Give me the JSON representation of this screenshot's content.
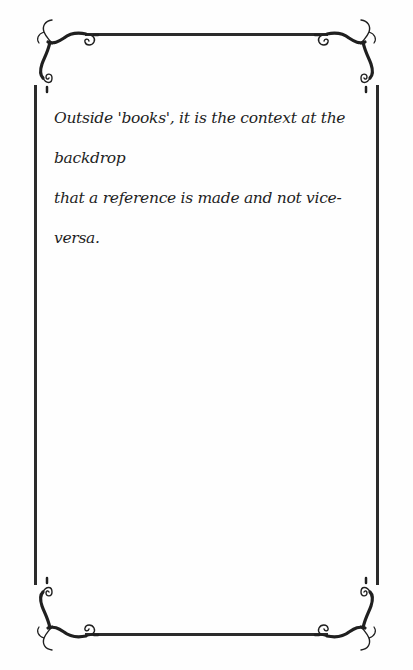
{
  "document": {
    "lines": [
      "Outside 'books', it is the context at the backdrop",
      "that a reference is made and not vice-versa."
    ],
    "ink_color": "#2b2b2b"
  },
  "ornaments": {
    "corner_icon": "scroll-flourish-icon",
    "frame_style": "thin-line-border"
  }
}
